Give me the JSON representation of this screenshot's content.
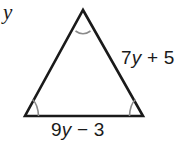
{
  "figure": {
    "type": "geometry-triangle-diagram",
    "background_color": "#ffffff",
    "stroke_color": "#1a1a1a",
    "arc_color": "#8a8a8a",
    "text_color": "#1a1a1a",
    "variable_label": "y",
    "triangle": {
      "name": "isosceles-triangle",
      "apex": [
        83,
        10
      ],
      "base_left": [
        25,
        116
      ],
      "base_right": [
        143,
        116
      ],
      "angle_marks": [
        "apex-angle-arc",
        "base-left-angle-arc",
        "base-right-angle-arc"
      ],
      "angle_mark_count": 3
    },
    "labels": {
      "side_right": {
        "text": "7y + 5",
        "coefficient": "7",
        "variable": "y",
        "operator": "+",
        "constant": "5"
      },
      "side_base": {
        "text": "9y − 3",
        "coefficient": "9",
        "variable": "y",
        "operator": "−",
        "constant": "3"
      }
    }
  }
}
